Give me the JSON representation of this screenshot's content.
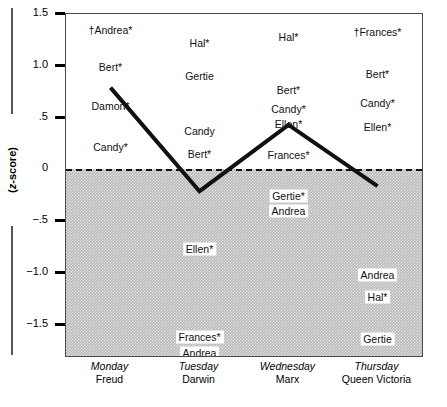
{
  "chart_data": {
    "type": "line",
    "title": "",
    "xlabel": "",
    "ylabel": "(z-score)",
    "ylim": [
      -1.8,
      1.5
    ],
    "grid": false,
    "legend": "none",
    "categories": [
      "Monday",
      "Tuesday",
      "Wednesday",
      "Thursday"
    ],
    "category_sublabels": [
      "Freud",
      "Darwin",
      "Marx",
      "Queen Victoria"
    ],
    "series": [
      {
        "name": "mean z-score",
        "values": [
          0.79,
          -0.21,
          0.43,
          -0.16
        ]
      }
    ],
    "yticks": [
      1.5,
      1.0,
      0.5,
      0,
      -0.5,
      -1.0,
      -1.5
    ],
    "ytick_labels": [
      "1.5",
      "1.0",
      ".5",
      "0",
      "−.5",
      "−1.0",
      "−1.5"
    ],
    "zero_reference_line": 0,
    "shaded_region": "below zero",
    "annotations": [
      {
        "text": "†Andrea*",
        "category": "Monday",
        "z": 1.35,
        "boxed": false
      },
      {
        "text": "Bert*",
        "category": "Monday",
        "z": 0.99,
        "boxed": false
      },
      {
        "text": "Damon*",
        "category": "Monday",
        "z": 0.61,
        "boxed": false
      },
      {
        "text": "Candy*",
        "category": "Monday",
        "z": 0.22,
        "boxed": false
      },
      {
        "text": "Hal*",
        "category": "Tuesday",
        "z": 1.22,
        "boxed": false
      },
      {
        "text": "Gertie",
        "category": "Tuesday",
        "z": 0.9,
        "boxed": false
      },
      {
        "text": "Candy",
        "category": "Tuesday",
        "z": 0.37,
        "boxed": false
      },
      {
        "text": "Bert*",
        "category": "Tuesday",
        "z": 0.15,
        "boxed": false
      },
      {
        "text": "Ellen*",
        "category": "Tuesday",
        "z": -0.77,
        "boxed": true
      },
      {
        "text": "Frances*",
        "category": "Tuesday",
        "z": -1.62,
        "boxed": true
      },
      {
        "text": "Andrea",
        "category": "Tuesday",
        "z": -1.77,
        "boxed": true
      },
      {
        "text": "Hal*",
        "category": "Wednesday",
        "z": 1.28,
        "boxed": false
      },
      {
        "text": "Bert*",
        "category": "Wednesday",
        "z": 0.77,
        "boxed": false
      },
      {
        "text": "Candy*",
        "category": "Wednesday",
        "z": 0.58,
        "boxed": false
      },
      {
        "text": "Ellen*",
        "category": "Wednesday",
        "z": 0.44,
        "boxed": false
      },
      {
        "text": "Frances*",
        "category": "Wednesday",
        "z": 0.14,
        "boxed": false
      },
      {
        "text": "Gertie*",
        "category": "Wednesday",
        "z": -0.26,
        "boxed": true
      },
      {
        "text": "Andrea",
        "category": "Wednesday",
        "z": -0.4,
        "boxed": true
      },
      {
        "text": "†Frances*",
        "category": "Thursday",
        "z": 1.33,
        "boxed": false
      },
      {
        "text": "Bert*",
        "category": "Thursday",
        "z": 0.92,
        "boxed": false
      },
      {
        "text": "Candy*",
        "category": "Thursday",
        "z": 0.64,
        "boxed": false
      },
      {
        "text": "Ellen*",
        "category": "Thursday",
        "z": 0.41,
        "boxed": false
      },
      {
        "text": "Andrea",
        "category": "Thursday",
        "z": -1.02,
        "boxed": true
      },
      {
        "text": "Hal*",
        "category": "Thursday",
        "z": -1.23,
        "boxed": true
      },
      {
        "text": "Gertie",
        "category": "Thursday",
        "z": -1.64,
        "boxed": true
      }
    ],
    "colors": {
      "line": "#111111",
      "shade": "#b9b9b9",
      "frame": "#4a4a4a",
      "zero_line": "#111111"
    }
  }
}
